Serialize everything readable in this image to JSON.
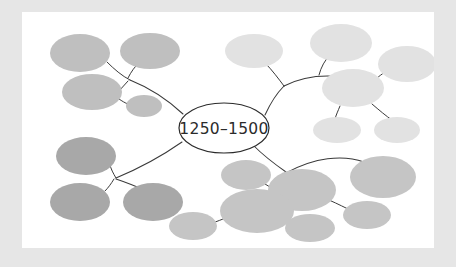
{
  "document": {
    "type": "mind-map-diagram",
    "title_visible": false,
    "page_background_color": "#e6e6e6",
    "canvas_background_color": "#ffffff"
  },
  "center_node": {
    "label": "1250–1500",
    "fill_color": "#ffffff",
    "stroke_color": "#2b2b2b",
    "cx": 202,
    "cy": 116,
    "rx": 45,
    "ry": 25
  },
  "connector": {
    "color": "#3a3a3a",
    "width": 1.05
  },
  "branches": [
    {
      "id": "branch-top-left",
      "direction": "top-left",
      "fill_color": "#bfbfbf",
      "nodes": [
        {
          "id": "tl-1",
          "cx": 58,
          "cy": 41,
          "rx": 30,
          "ry": 19
        },
        {
          "id": "tl-2",
          "cx": 128,
          "cy": 39,
          "rx": 30,
          "ry": 18
        },
        {
          "id": "tl-3",
          "cx": 70,
          "cy": 80,
          "rx": 30,
          "ry": 18
        },
        {
          "id": "tl-4",
          "cx": 122,
          "cy": 94,
          "rx": 18,
          "ry": 11
        }
      ],
      "links": [
        {
          "from": "center",
          "to": "junction-tl"
        },
        {
          "from": "junction-tl",
          "to": "tl-1"
        },
        {
          "from": "junction-tl",
          "to": "tl-2"
        },
        {
          "from": "junction-tl",
          "to": "tl-3"
        },
        {
          "from": "tl-3",
          "to": "tl-4"
        }
      ]
    },
    {
      "id": "branch-top-right",
      "direction": "top-right",
      "fill_color": "#e2e2e2",
      "nodes": [
        {
          "id": "tr-1",
          "cx": 232,
          "cy": 39,
          "rx": 29,
          "ry": 17
        },
        {
          "id": "tr-2",
          "cx": 319,
          "cy": 31,
          "rx": 31,
          "ry": 19
        },
        {
          "id": "tr-3",
          "cx": 385,
          "cy": 52,
          "rx": 29,
          "ry": 18
        },
        {
          "id": "tr-4",
          "cx": 331,
          "cy": 76,
          "rx": 31,
          "ry": 19
        },
        {
          "id": "tr-5",
          "cx": 315,
          "cy": 118,
          "rx": 24,
          "ry": 13
        },
        {
          "id": "tr-6",
          "cx": 375,
          "cy": 118,
          "rx": 23,
          "ry": 13
        }
      ],
      "links": [
        {
          "from": "center",
          "to": "junction-tr"
        },
        {
          "from": "junction-tr",
          "to": "tr-1"
        },
        {
          "from": "junction-tr",
          "to": "tr-2"
        },
        {
          "from": "junction-tr",
          "to": "tr-4"
        },
        {
          "from": "tr-4",
          "to": "tr-3"
        },
        {
          "from": "tr-4",
          "to": "tr-5"
        },
        {
          "from": "tr-4",
          "to": "tr-6"
        }
      ]
    },
    {
      "id": "branch-bottom-left",
      "direction": "bottom-left",
      "fill_color": "#a8a8a8",
      "nodes": [
        {
          "id": "bl-1",
          "cx": 64,
          "cy": 144,
          "rx": 30,
          "ry": 19
        },
        {
          "id": "bl-2",
          "cx": 58,
          "cy": 190,
          "rx": 30,
          "ry": 19
        },
        {
          "id": "bl-3",
          "cx": 131,
          "cy": 190,
          "rx": 30,
          "ry": 19
        }
      ],
      "links": [
        {
          "from": "center",
          "to": "junction-bl"
        },
        {
          "from": "junction-bl",
          "to": "bl-1"
        },
        {
          "from": "junction-bl",
          "to": "bl-2"
        },
        {
          "from": "junction-bl",
          "to": "bl-3"
        }
      ]
    },
    {
      "id": "branch-bottom-right",
      "direction": "bottom-right",
      "fill_color": "#c5c5c5",
      "nodes": [
        {
          "id": "br-1",
          "cx": 280,
          "cy": 178,
          "rx": 34,
          "ry": 21
        },
        {
          "id": "br-2",
          "cx": 361,
          "cy": 165,
          "rx": 33,
          "ry": 21
        },
        {
          "id": "br-3",
          "cx": 224,
          "cy": 163,
          "rx": 25,
          "ry": 15
        },
        {
          "id": "br-4",
          "cx": 235,
          "cy": 199,
          "rx": 37,
          "ry": 22
        },
        {
          "id": "br-5",
          "cx": 171,
          "cy": 214,
          "rx": 24,
          "ry": 14
        },
        {
          "id": "br-6",
          "cx": 288,
          "cy": 216,
          "rx": 25,
          "ry": 14
        },
        {
          "id": "br-7",
          "cx": 345,
          "cy": 203,
          "rx": 24,
          "ry": 14
        }
      ],
      "links": [
        {
          "from": "center",
          "to": "br-1"
        },
        {
          "from": "br-1",
          "to": "br-2"
        },
        {
          "from": "br-1",
          "to": "br-4"
        },
        {
          "from": "br-1",
          "to": "br-7"
        },
        {
          "from": "br-3",
          "to": "br-4"
        },
        {
          "from": "br-4",
          "to": "br-5"
        },
        {
          "from": "br-4",
          "to": "br-6"
        }
      ]
    }
  ]
}
